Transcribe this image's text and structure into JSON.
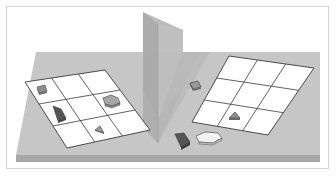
{
  "figure": {
    "colors": {
      "background": "#ffffff",
      "frame": "#d4d4d4",
      "floor": "#c3c3c3",
      "floor_front_edge": "#a9a9a9",
      "mirror": "#b7b7b7",
      "grid_fill": "#ffffff",
      "grid_line": "#3a3a3a",
      "piece_light": "#9a9a9a",
      "piece_dark": "#555555"
    },
    "left_grid": {
      "rows": 3,
      "cols": 3,
      "pieces": [
        {
          "shape": "square",
          "cell": [
            0,
            0
          ]
        },
        {
          "shape": "quadrilateral-dark",
          "cell": [
            1,
            0
          ]
        },
        {
          "shape": "hexagon",
          "cell": [
            1,
            2
          ]
        },
        {
          "shape": "triangle",
          "cell": [
            2,
            1
          ]
        }
      ]
    },
    "right_grid": {
      "rows": 3,
      "cols": 3,
      "pieces": [
        {
          "shape": "triangle",
          "cell": [
            2,
            1
          ]
        }
      ]
    },
    "loose_pieces_right": [
      {
        "shape": "square"
      },
      {
        "shape": "quadrilateral-dark"
      },
      {
        "shape": "hexagon"
      }
    ]
  }
}
